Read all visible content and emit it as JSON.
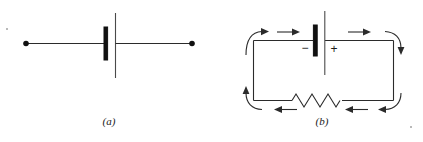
{
  "figure": {
    "caption_a": "(a)",
    "caption_b": "(b)",
    "panels": [
      {
        "id": "a",
        "label": "(a)",
        "title": "Battery symbol with open terminals",
        "elements": [
          "left-terminal-dot",
          "left-lead-wire",
          "battery-negative-plate",
          "battery-positive-plate",
          "right-lead-wire",
          "right-terminal-dot"
        ]
      },
      {
        "id": "b",
        "label": "(b)",
        "title": "Closed circuit with battery and resistor showing conventional current direction",
        "elements": [
          "circuit-loop-wire",
          "battery-negative-plate",
          "battery-positive-plate",
          "polarity-minus",
          "polarity-plus",
          "resistor-zigzag",
          "current-arrows"
        ]
      }
    ],
    "polarity": {
      "minus": "−",
      "plus": "+"
    },
    "current_arrows": {
      "top_left_arc": "clockwise-up-right",
      "top_straight_left": "right",
      "top_straight_right": "right",
      "top_right_arc": "clockwise-right-down",
      "bottom_right_arc": "clockwise-down-left",
      "bottom_straight_right": "left",
      "bottom_straight_left": "left",
      "bottom_left_arc": "clockwise-left-up",
      "count": 8
    },
    "resistor": {
      "peaks": 6
    },
    "colors": {
      "ink": "#2b2b2b",
      "plate_dark": "#111111",
      "plate_light": "#4a4a4a",
      "background": "#ffffff"
    }
  }
}
